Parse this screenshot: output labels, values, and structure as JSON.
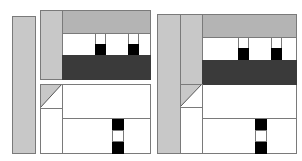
{
  "diagram": {
    "colors": {
      "light_gray": "#c8c8c8",
      "mid_gray": "#b4b4b4",
      "dark_band": "#3a3a3a",
      "block": "#000000",
      "border": "#7a7a7a",
      "background": "#ffffff"
    },
    "left_layout": {
      "regions": [
        "sidebar",
        "top-panel-column",
        "top-bar",
        "content-row",
        "dark-band",
        "bottom-panel",
        "corner-triangle",
        "stacked-blocks"
      ],
      "black_square_count": 2,
      "stack_blocks": [
        "black",
        "white",
        "black"
      ]
    },
    "right_layout": {
      "regions": [
        "sidebar",
        "secondary-column",
        "top-bar",
        "content-row",
        "dark-band",
        "corner-triangle",
        "lower-area",
        "stacked-blocks"
      ],
      "black_square_count": 2,
      "stack_blocks": [
        "black",
        "white",
        "black"
      ]
    }
  },
  "caption": {
    "text": "· · · · · · · ·  · · · · · · · · ·"
  }
}
